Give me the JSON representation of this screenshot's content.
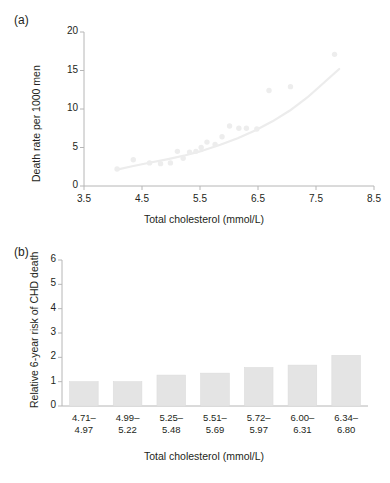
{
  "figure": {
    "panels": [
      {
        "tag": "(a)",
        "xlabel": "Total cholesterol (mmol/L)",
        "ylabel": "Death rate per 1000 men"
      },
      {
        "tag": "(b)",
        "xlabel": "Total cholesterol (mmol/L)",
        "ylabel": "Relative 6-year risk of CHD death"
      }
    ]
  },
  "colors": {
    "text": "#231f20",
    "axis": "#b6b6b6",
    "marker": "#ededed",
    "curve": "#ececec",
    "bar": "#e4e4e4",
    "bar_edge": "#dcdcdc",
    "background": "#ffffff"
  },
  "chart_data": [
    {
      "type": "scatter",
      "panel": "(a)",
      "title": "",
      "xlabel": "Total cholesterol (mmol/L)",
      "ylabel": "Death rate per 1000 men",
      "xlim": [
        3.5,
        8.5
      ],
      "ylim": [
        0,
        20
      ],
      "xticks": [
        3.5,
        4.5,
        5.5,
        6.5,
        7.5,
        8.5
      ],
      "xticklabels": [
        "3.5",
        "4.5",
        "5.5",
        "6.5",
        "7.5",
        "8.5"
      ],
      "yticks": [
        0,
        5,
        10,
        15,
        20
      ],
      "yticklabels": [
        "0",
        "5",
        "10",
        "15",
        "20"
      ],
      "grid": false,
      "legend": "none",
      "points": [
        {
          "x": 4.07,
          "y": 2.2
        },
        {
          "x": 4.35,
          "y": 3.4
        },
        {
          "x": 4.63,
          "y": 3.0
        },
        {
          "x": 4.82,
          "y": 2.9
        },
        {
          "x": 4.99,
          "y": 3.0
        },
        {
          "x": 5.11,
          "y": 4.5
        },
        {
          "x": 5.21,
          "y": 3.6
        },
        {
          "x": 5.32,
          "y": 4.4
        },
        {
          "x": 5.43,
          "y": 4.5
        },
        {
          "x": 5.52,
          "y": 5.0
        },
        {
          "x": 5.62,
          "y": 5.7
        },
        {
          "x": 5.76,
          "y": 5.4
        },
        {
          "x": 5.88,
          "y": 6.4
        },
        {
          "x": 6.01,
          "y": 7.8
        },
        {
          "x": 6.17,
          "y": 7.5
        },
        {
          "x": 6.3,
          "y": 7.5
        },
        {
          "x": 6.48,
          "y": 7.4
        },
        {
          "x": 6.69,
          "y": 12.4
        },
        {
          "x": 7.06,
          "y": 12.9
        },
        {
          "x": 7.82,
          "y": 17.1
        }
      ],
      "fit_curve": {
        "name": "fitted trend",
        "x": [
          4.05,
          4.35,
          4.65,
          4.95,
          5.25,
          5.55,
          5.85,
          6.15,
          6.45,
          6.75,
          7.05,
          7.35,
          7.65,
          7.9
        ],
        "y": [
          2.1,
          2.6,
          3.05,
          3.5,
          4.0,
          4.6,
          5.35,
          6.2,
          7.2,
          8.4,
          9.8,
          11.5,
          13.5,
          15.2
        ]
      }
    },
    {
      "type": "bar",
      "panel": "(b)",
      "title": "",
      "xlabel": "Total cholesterol (mmol/L)",
      "ylabel": "Relative 6-year risk of CHD death",
      "ylim": [
        0,
        6
      ],
      "yticks": [
        0,
        1,
        2,
        3,
        4,
        5,
        6
      ],
      "yticklabels": [
        "0",
        "1",
        "2",
        "3",
        "4",
        "5",
        "6"
      ],
      "grid": false,
      "legend": "none",
      "categories": [
        "4.71–\n4.97",
        "4.99–\n5.22",
        "5.25–\n5.48",
        "5.51–\n5.69",
        "5.72–\n5.97",
        "6.00–\n6.31",
        "6.34–\n6.80"
      ],
      "category_lines": [
        [
          "4.71–",
          "4.97"
        ],
        [
          "4.99–",
          "5.22"
        ],
        [
          "5.25–",
          "5.48"
        ],
        [
          "5.51–",
          "5.69"
        ],
        [
          "5.72–",
          "5.97"
        ],
        [
          "6.00–",
          "6.31"
        ],
        [
          "6.34–",
          "6.80"
        ]
      ],
      "values": [
        1.0,
        1.0,
        1.27,
        1.35,
        1.58,
        1.68,
        2.08
      ]
    }
  ]
}
